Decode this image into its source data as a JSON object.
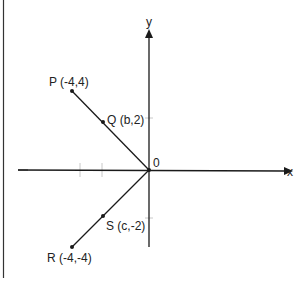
{
  "diagram": {
    "type": "coordinate-plane",
    "axes": {
      "x_label": "x",
      "y_label": "y",
      "origin_label": "0"
    },
    "points": [
      {
        "id": "P",
        "label": "P (-4,4)",
        "coords": [
          -4,
          4
        ]
      },
      {
        "id": "Q",
        "label": "Q (b,2)",
        "coords": [
          "b",
          2
        ]
      },
      {
        "id": "R",
        "label": "R (-4,-4)",
        "coords": [
          -4,
          -4
        ]
      },
      {
        "id": "S",
        "label": "S (c,-2)",
        "coords": [
          "c",
          -2
        ]
      }
    ],
    "segments": [
      {
        "from": "P",
        "to": "O",
        "passes_through": "Q"
      },
      {
        "from": "R",
        "to": "O",
        "passes_through": "S"
      }
    ],
    "colors": {
      "line": "#1a1a1a",
      "tick": "#bbbbbb",
      "background": "#ffffff"
    }
  }
}
